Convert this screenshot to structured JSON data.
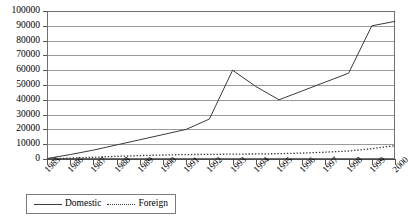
{
  "chart_data": {
    "type": "line",
    "title": "",
    "xlabel": "",
    "ylabel": "",
    "grid": true,
    "legend_position": "bottom-left",
    "ylim": [
      0,
      100000
    ],
    "ytick_labels": [
      "100000",
      "90000",
      "80000",
      "70000",
      "60000",
      "50000",
      "40000",
      "30000",
      "20000",
      "10000",
      "0"
    ],
    "ytick_values": [
      100000,
      90000,
      80000,
      70000,
      60000,
      50000,
      40000,
      30000,
      20000,
      10000,
      0
    ],
    "categories": [
      "1985",
      "1986",
      "1987",
      "1988",
      "1989",
      "1990",
      "1991",
      "1992",
      "1993",
      "1994",
      "1995",
      "1996",
      "1997",
      "1998",
      "1999",
      "2000"
    ],
    "series": [
      {
        "name": "Domestic",
        "style": "solid",
        "color": "#3a3a3a",
        "values": [
          300,
          3000,
          6000,
          9500,
          13000,
          16500,
          20000,
          27000,
          60000,
          49000,
          40000,
          46000,
          52000,
          58000,
          90000,
          93000
        ]
      },
      {
        "name": "Foreign",
        "style": "dotted",
        "color": "#3a3a3a",
        "values": [
          100,
          600,
          1200,
          1800,
          2300,
          2700,
          3000,
          3100,
          3300,
          3400,
          3600,
          4000,
          4600,
          5400,
          7000,
          9000
        ]
      }
    ]
  },
  "legend": {
    "items": [
      {
        "label": "Domestic",
        "style": "solid"
      },
      {
        "label": "Foreign",
        "style": "dotted"
      }
    ]
  }
}
